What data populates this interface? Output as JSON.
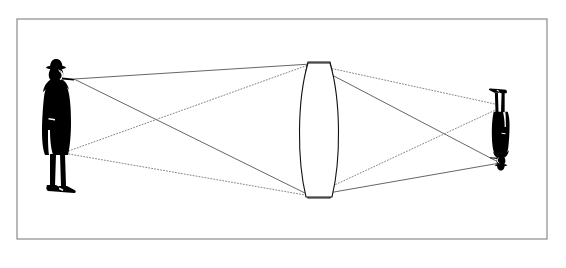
{
  "figure": {
    "title": "Converging lens ray diagram",
    "background_color": "#ffffff",
    "frame": {
      "name": "figure-border",
      "x": 17,
      "y": 19,
      "width": 530,
      "height": 220,
      "stroke_color": "#8a8a8a",
      "stroke_width": 1.2,
      "fill": "#ffffff"
    },
    "ink_color": "#000000",
    "ray_color": "#555555",
    "lens_stroke_color": "#111111"
  },
  "object_figure": {
    "name": "man-silhouette-object",
    "label": "Man with bowler hat and pipe (object)",
    "orientation": "upright",
    "fill": "#000000",
    "bounds": {
      "x": 38,
      "y": 58,
      "width": 52,
      "height": 140
    },
    "head_ray_origin": {
      "x": 74,
      "y": 79
    },
    "feet_ray_origin": {
      "x": 63,
      "y": 153
    }
  },
  "image_figure": {
    "name": "man-silhouette-image",
    "label": "Man with bowler hat and pipe (inverted image)",
    "orientation": "inverted",
    "fill": "#000000",
    "bounds": {
      "x": 486,
      "y": 86,
      "width": 26,
      "height": 85
    },
    "head_ray_target": {
      "x": 500,
      "y": 163
    },
    "feet_ray_target": {
      "x": 504,
      "y": 106
    }
  },
  "lens": {
    "name": "biconvex-lens",
    "label": "Biconvex converging lens",
    "center_x": 319,
    "top_y": 62,
    "bottom_y": 198,
    "half_width": 15,
    "mount_half_width": 11,
    "mount_height": 9,
    "stroke_color": "#111111",
    "stroke_width": 1.1,
    "fill": "#ffffff"
  },
  "rays": {
    "solid": {
      "name": "head-rays",
      "label": "Rays from the head (solid)",
      "style": "solid",
      "color": "#555555",
      "width": 0.9,
      "paths": [
        {
          "name": "head-ray-upper",
          "points": [
            [
              74,
              79
            ],
            [
              311,
              64
            ],
            [
              500,
              163
            ]
          ]
        },
        {
          "name": "head-ray-lower",
          "points": [
            [
              74,
              79
            ],
            [
              311,
              196
            ],
            [
              500,
              163
            ]
          ]
        }
      ]
    },
    "dotted": {
      "name": "feet-rays",
      "label": "Rays from the feet (dotted)",
      "style": "dotted",
      "color": "#777777",
      "width": 0.9,
      "dash": "1 2",
      "paths": [
        {
          "name": "feet-ray-upper",
          "points": [
            [
              63,
              153
            ],
            [
              311,
              64
            ],
            [
              504,
              106
            ]
          ]
        },
        {
          "name": "feet-ray-lower",
          "points": [
            [
              63,
              153
            ],
            [
              311,
              196
            ],
            [
              504,
              106
            ]
          ]
        }
      ]
    }
  },
  "annotations": {
    "crossing_point": {
      "name": "ray-crossing",
      "x": 155,
      "y": 118,
      "visible": false
    }
  }
}
